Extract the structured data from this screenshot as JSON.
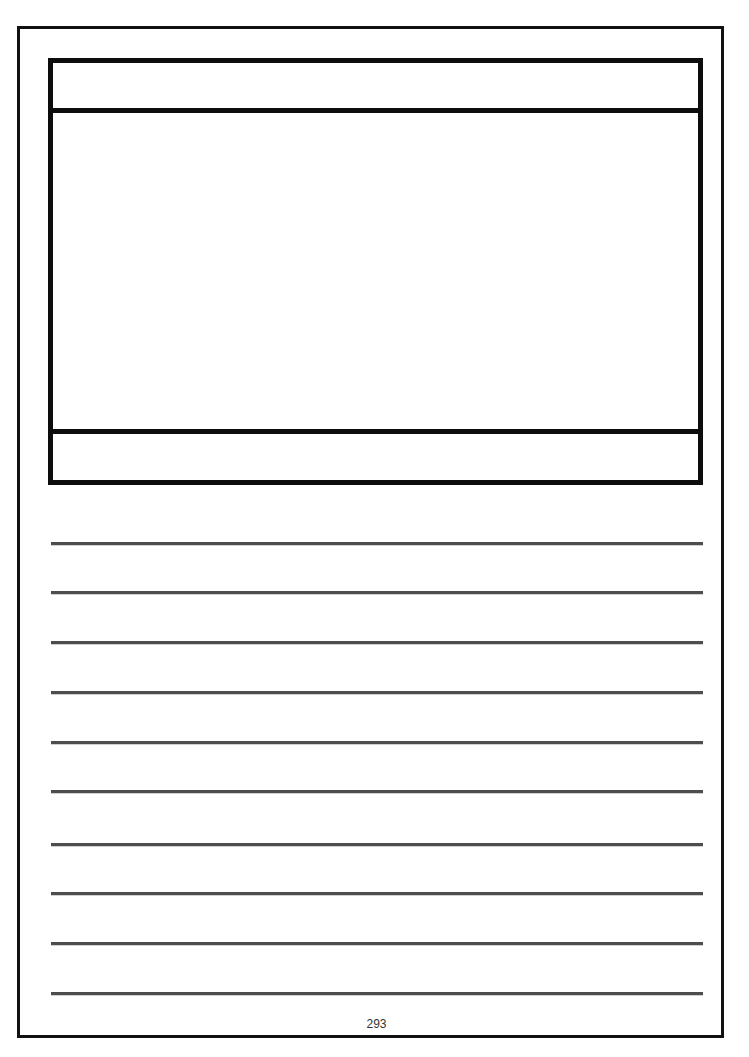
{
  "page": {
    "number": "293",
    "background_color": "#ffffff",
    "border_color": "#111111",
    "line_color": "#4d4d4d"
  },
  "frame_box": {
    "header_text": "",
    "body_text": "",
    "footer_text": ""
  },
  "writing_lines": {
    "count": 10,
    "positions_y": [
      543,
      592,
      642,
      692,
      742,
      791,
      844,
      893,
      943,
      993
    ]
  }
}
